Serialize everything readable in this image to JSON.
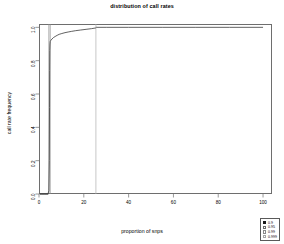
{
  "chart_data": {
    "type": "line",
    "title": "distribution of call rates",
    "xlabel": "proportion of snps",
    "ylabel": "call rate frequency",
    "xlim": [
      0,
      104
    ],
    "ylim": [
      0.0,
      1.02
    ],
    "grid": false,
    "legend_position": "bottom-right",
    "xticks": [
      "0",
      "20",
      "40",
      "60",
      "80",
      "100"
    ],
    "xtick_values": [
      0,
      20,
      40,
      60,
      80,
      100
    ],
    "yticks": [
      "0.0",
      "0.2",
      "0.4",
      "0.6",
      "0.8",
      "1.0"
    ],
    "ytick_values": [
      0.0,
      0.2,
      0.4,
      0.6,
      0.8,
      1.0
    ],
    "series": [
      {
        "name": "0.9",
        "color": "#3a3a3a",
        "x": [
          0.3,
          1.2,
          2.4,
          3.3,
          4.0,
          4.4,
          4.6,
          4.7,
          4.75,
          4.8,
          4.9,
          5.0,
          5.3,
          5.8,
          6.4,
          7.2,
          8.1,
          9.0,
          10.2,
          11.6,
          13.0,
          14.6,
          16.4,
          18.6,
          21.0,
          23.4,
          25.2,
          25.6,
          30.0,
          40.0,
          55.0,
          70.0,
          85.0,
          100.0
        ],
        "y": [
          0.0,
          0.0,
          0.0,
          0.0,
          0.0,
          0.02,
          0.2,
          0.52,
          0.74,
          0.86,
          0.9,
          0.915,
          0.922,
          0.93,
          0.938,
          0.945,
          0.952,
          0.958,
          0.963,
          0.968,
          0.972,
          0.976,
          0.98,
          0.984,
          0.988,
          0.992,
          0.996,
          1.0,
          1.0,
          1.0,
          1.0,
          1.0,
          1.0,
          1.0
        ]
      }
    ],
    "vlines": [
      {
        "x": 4.4,
        "style": "solid",
        "color": "#8a8a8a"
      },
      {
        "x": 5.0,
        "style": "solid",
        "color": "#8a8a8a"
      },
      {
        "x": 25.4,
        "style": "solid",
        "color": "#b0b0b0"
      }
    ],
    "baseline_segment": {
      "x_start": 0.4,
      "x_end": 4.2,
      "y": 0.0,
      "color": "#3a3a3a"
    },
    "legend_entries": [
      {
        "label": "0.9",
        "marker": "filled-square",
        "color": "#1a1a1a"
      },
      {
        "label": "0.95",
        "marker": "open-square",
        "color": "#6a6a6a"
      },
      {
        "label": "0.99",
        "marker": "open-square",
        "color": "#8a8a8a"
      },
      {
        "label": "0.999",
        "marker": "open-square",
        "color": "#a6a6a6"
      }
    ]
  }
}
